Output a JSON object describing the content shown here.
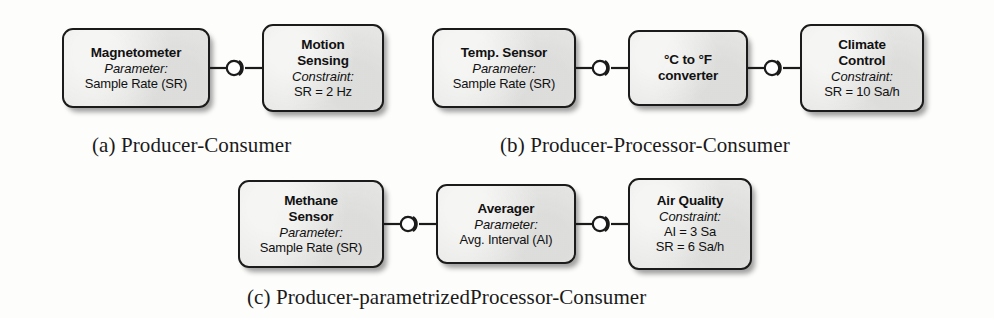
{
  "figure": {
    "background_color": "#fdfdfc",
    "node_fill_color": "#e9e9e7",
    "node_border_color": "#1b1b1b",
    "text_color": "#111111"
  },
  "panels": [
    {
      "id": "a",
      "caption": "(a) Producer-Consumer",
      "nodes": [
        {
          "role": "producer",
          "title": "Magnetometer",
          "kind": "Parameter:",
          "values": [
            "Sample Rate (SR)"
          ]
        },
        {
          "role": "consumer",
          "title_lines": [
            "Motion",
            "Sensing"
          ],
          "kind": "Constraint:",
          "values": [
            "SR = 2 Hz"
          ]
        }
      ],
      "connectors": [
        "ball-and-socket-connector"
      ]
    },
    {
      "id": "b",
      "caption": "(b) Producer-Processor-Consumer",
      "nodes": [
        {
          "role": "producer",
          "title": "Temp. Sensor",
          "kind": "Parameter:",
          "values": [
            "Sample Rate (SR)"
          ]
        },
        {
          "role": "processor",
          "title_lines": [
            "°C to °F",
            "converter"
          ],
          "kind": "",
          "values": []
        },
        {
          "role": "consumer",
          "title_lines": [
            "Climate",
            "Control"
          ],
          "kind": "Constraint:",
          "values": [
            "SR = 10 Sa/h"
          ]
        }
      ],
      "connectors": [
        "ball-and-socket-connector",
        "ball-and-socket-connector"
      ]
    },
    {
      "id": "c",
      "caption": "(c) Producer-parametrizedProcessor-Consumer",
      "nodes": [
        {
          "role": "producer",
          "title_lines": [
            "Methane",
            "Sensor"
          ],
          "kind": "Parameter:",
          "values": [
            "Sample Rate (SR)"
          ]
        },
        {
          "role": "parametrized-processor",
          "title": "Averager",
          "kind": "Parameter:",
          "values": [
            "Avg. Interval (AI)"
          ]
        },
        {
          "role": "consumer",
          "title": "Air Quality",
          "kind": "Constraint:",
          "values": [
            "AI = 3 Sa",
            "SR = 6 Sa/h"
          ]
        }
      ],
      "connectors": [
        "ball-and-socket-connector",
        "ball-and-socket-connector"
      ]
    }
  ]
}
